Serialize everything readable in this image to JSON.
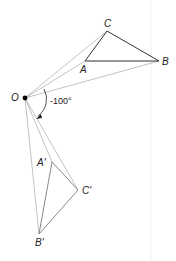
{
  "diagram": {
    "type": "rotation",
    "center": {
      "label": "O",
      "x": 25,
      "y": 98
    },
    "angle_label": "-100°",
    "original_triangle": {
      "A": {
        "label": "A",
        "x": 85,
        "y": 61
      },
      "B": {
        "label": "B",
        "x": 159,
        "y": 61
      },
      "C": {
        "label": "C",
        "x": 107,
        "y": 31
      }
    },
    "image_triangle": {
      "A": {
        "label": "A'",
        "x": 52,
        "y": 162
      },
      "B": {
        "label": "B'",
        "x": 39,
        "y": 234
      },
      "C": {
        "label": "C'",
        "x": 78,
        "y": 190
      }
    },
    "colors": {
      "original": "#333333",
      "image": "#888888",
      "rays": "#999999",
      "point": "#000000"
    }
  }
}
